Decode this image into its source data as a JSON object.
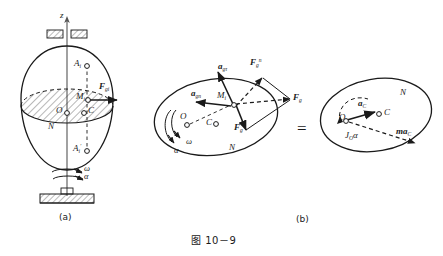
{
  "figure": {
    "caption": "图 10－9",
    "panel_a_label": "(a)",
    "panel_b_label": "(b)",
    "equals_sign": "=",
    "line_color": "#1a1a1a",
    "background": "#ffffff"
  },
  "panel_a": {
    "axis_z": "z",
    "point_A_i": "A",
    "point_A_i_sub": "i",
    "point_A_i_prime": "A",
    "point_A_i_prime_sub": "i",
    "point_A_i_prime_mark": "′",
    "point_O": "O",
    "point_C": "C",
    "point_M_i": "M",
    "point_M_i_sub": "i",
    "label_N": "N",
    "force_F": "F",
    "force_F_sub": "g",
    "force_F_sup": "i",
    "omega": "ω",
    "alpha": "α"
  },
  "panel_b": {
    "point_O": "O",
    "point_C": "C",
    "point_M_i": "M",
    "point_M_i_sub": "i",
    "label_N": "N",
    "omega": "ω",
    "alpha": "α",
    "accel_tau": "a",
    "accel_tau_sub": "gτ",
    "accel_n": "a",
    "accel_n_sub": "gn",
    "force_n": "F",
    "force_n_sub": "g",
    "force_n_sup": "n",
    "force_tau": "F",
    "force_tau_sub": "g",
    "force_tau_sup": "τ",
    "force_res": "F",
    "force_res_sub": "g"
  },
  "panel_c": {
    "point_O": "O",
    "point_C": "C",
    "label_N": "N",
    "accel_C": "a",
    "accel_C_sub": "C",
    "inertia_force": "ma",
    "inertia_force_sub": "C",
    "moment": "J",
    "moment_sub": "O",
    "moment_alpha": "α"
  }
}
